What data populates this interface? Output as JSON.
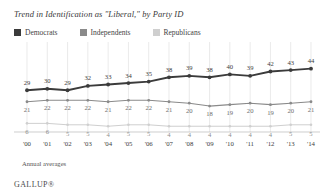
{
  "chart_title": "Trend in Identification as \"Liberal,\" by Party ID",
  "legend": {
    "items": [
      {
        "label": "Democrats",
        "color": "#3b3b3b"
      },
      {
        "label": "Independents",
        "color": "#8a8a8a"
      },
      {
        "label": "Republicans",
        "color": "#cfcfcf"
      }
    ]
  },
  "footnote": "Annual averages",
  "brand": "GALLUP®",
  "colors": {
    "democrats": "#3b3b3b",
    "independents": "#8a8a8a",
    "republicans": "#cfcfcf",
    "gridline": "#dcdcdc",
    "axis": "#b9b9b9",
    "background": "#ffffff",
    "text": "#3a3a3a"
  },
  "chart_data": {
    "type": "line",
    "title": "Trend in Identification as \"Liberal,\" by Party ID",
    "subtitle": "",
    "xlabel": "",
    "ylabel": "",
    "categories": [
      "'00",
      "'01",
      "'02",
      "'03",
      "'04",
      "'05",
      "'06",
      "'07",
      "'08",
      "'09",
      "'10",
      "'11",
      "'12",
      "'13",
      "'14"
    ],
    "series": [
      {
        "name": "Democrats",
        "color": "#3b3b3b",
        "values": [
          29,
          30,
          29,
          32,
          33,
          34,
          35,
          38,
          39,
          38,
          40,
          39,
          42,
          43,
          44
        ]
      },
      {
        "name": "Independents",
        "color": "#8a8a8a",
        "values": [
          21,
          22,
          22,
          22,
          21,
          22,
          22,
          21,
          20,
          18,
          19,
          20,
          19,
          20,
          21
        ]
      },
      {
        "name": "Republicans",
        "color": "#cfcfcf",
        "values": [
          6,
          6,
          5,
          5,
          4,
          5,
          5,
          4,
          4,
          4,
          4,
          4,
          4,
          5,
          5
        ]
      }
    ],
    "ylim": [
      0,
      50
    ],
    "grid": "vertical",
    "legend_position": "top-left",
    "annotation": "Annual averages"
  }
}
